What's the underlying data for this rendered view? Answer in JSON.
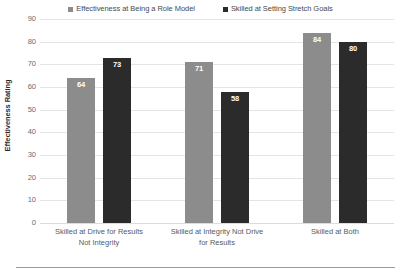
{
  "chart_data": {
    "type": "bar",
    "title": "",
    "xlabel": "",
    "ylabel": "Effectiveness Rating",
    "ylim": [
      0,
      90
    ],
    "ytick_step": 10,
    "yticks": [
      90,
      80,
      70,
      60,
      50,
      40,
      30,
      20,
      10,
      0
    ],
    "grid": true,
    "legend_position": "top-center",
    "categories": [
      "Skilled at Drive for Results Not Integrity",
      "Skilled at Integrity Not Drive for Results",
      "Skilled at Both"
    ],
    "category_lines": [
      [
        "Skilled at Drive for Results",
        "Not Integrity"
      ],
      [
        "Skilled at Integrity Not Drive",
        "for Results"
      ],
      [
        "Skilled at Both"
      ]
    ],
    "series": [
      {
        "name": "Effectiveness at Being a Role Model",
        "color": "#8c8c8c",
        "values": [
          64,
          71,
          84
        ]
      },
      {
        "name": "Skilled at Setting Stretch Goals",
        "color": "#2b2b2b",
        "values": [
          73,
          58,
          80
        ]
      }
    ]
  },
  "legend": {
    "items": [
      {
        "label": "Effectiveness at Being a Role Model",
        "color": "#8c8c8c"
      },
      {
        "label": "Skilled at Setting Stretch Goals",
        "color": "#2b2b2b"
      }
    ]
  },
  "axis": {
    "y_title": "Effectiveness Rating"
  }
}
